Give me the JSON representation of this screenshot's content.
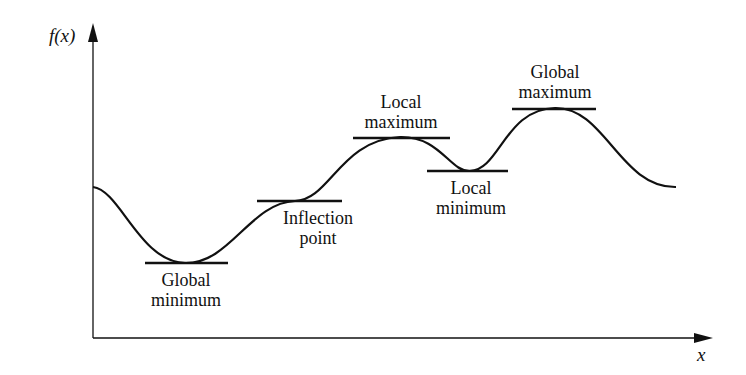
{
  "axes": {
    "y_label": "f(x)",
    "x_label": "x"
  },
  "labels": {
    "global_minimum": [
      "Global",
      "minimum"
    ],
    "inflection_point": [
      "Inflection",
      "point"
    ],
    "local_maximum": [
      "Local",
      "maximum"
    ],
    "local_minimum": [
      "Local",
      "minimum"
    ],
    "global_maximum": [
      "Global",
      "maximum"
    ]
  },
  "colors": {
    "line": "#111111",
    "background": "#ffffff"
  }
}
